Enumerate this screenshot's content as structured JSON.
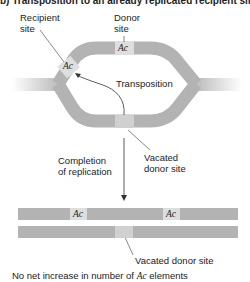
{
  "title": "b)    Transposition to an already replicated recipient site",
  "labels": {
    "recipient_site": [
      "Recipient",
      "site"
    ],
    "donor_site": [
      "Donor",
      "site"
    ],
    "transposition": "Transposition",
    "completion": [
      "Completion",
      "of replication"
    ],
    "vacated_top": [
      "Vacated",
      "donor site"
    ],
    "vacated_bottom": "Vacated donor site",
    "element": "Ac",
    "footer_prefix": "No net increase in number of ",
    "footer_element": "Ac",
    "footer_suffix": " elements"
  },
  "colors": {
    "dna": "#b3b3b3",
    "element_box": "#dedede",
    "vacated_box": "#d0d0d0",
    "text": "#222222"
  }
}
